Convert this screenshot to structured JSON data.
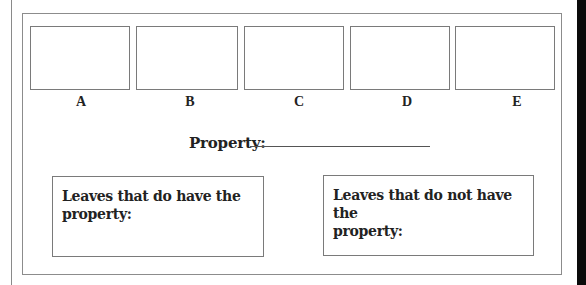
{
  "leaves": [
    {
      "label": "A"
    },
    {
      "label": "B"
    },
    {
      "label": "C"
    },
    {
      "label": "D"
    },
    {
      "label": "E"
    }
  ],
  "property": {
    "label": "Property:",
    "value": ""
  },
  "groups": {
    "have": {
      "line1": "Leaves that do have the",
      "line2": "property:"
    },
    "have_not": {
      "line1": "Leaves that do not have the",
      "line2": "property:"
    }
  }
}
